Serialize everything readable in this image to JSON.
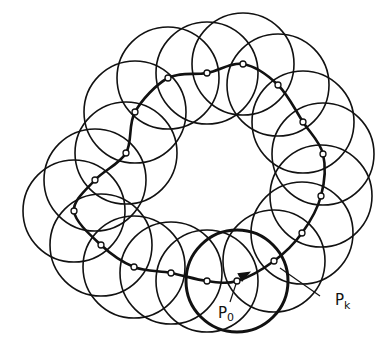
{
  "diagram": {
    "circle_radius": 51,
    "stroke_color": "#111111",
    "background": "#ffffff",
    "points": [
      {
        "x": 237,
        "y": 281
      },
      {
        "x": 274,
        "y": 261
      },
      {
        "x": 302,
        "y": 233
      },
      {
        "x": 321,
        "y": 196
      },
      {
        "x": 323,
        "y": 154
      },
      {
        "x": 303,
        "y": 122
      },
      {
        "x": 278,
        "y": 85
      },
      {
        "x": 243,
        "y": 64
      },
      {
        "x": 207,
        "y": 73
      },
      {
        "x": 168,
        "y": 78
      },
      {
        "x": 135,
        "y": 112
      },
      {
        "x": 126,
        "y": 153
      },
      {
        "x": 95,
        "y": 180
      },
      {
        "x": 74,
        "y": 211
      },
      {
        "x": 101,
        "y": 245
      },
      {
        "x": 134,
        "y": 267
      },
      {
        "x": 171,
        "y": 273
      },
      {
        "x": 207,
        "y": 281
      }
    ],
    "start_index": 0,
    "labels": {
      "p0": {
        "main": "P",
        "sub": "0"
      },
      "pk": {
        "main": "P",
        "sub": "k"
      }
    }
  }
}
